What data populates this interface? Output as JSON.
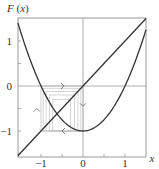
{
  "chart_data": {
    "type": "line",
    "title": "",
    "xlabel": "x",
    "ylabel": "F(x)",
    "xlim": [
      -1.55,
      1.5
    ],
    "ylim": [
      -1.58,
      1.52
    ],
    "xticks": [
      -1,
      0,
      1
    ],
    "yticks": [
      -1,
      0,
      1
    ],
    "xtick_labels": [
      "−1",
      "0",
      "1"
    ],
    "ytick_labels": [
      "−1",
      "0",
      "1"
    ],
    "grid": false,
    "legend": null,
    "series": [
      {
        "name": "F(x) = x^2 - 1",
        "kind": "parabola",
        "color": "#333333"
      },
      {
        "name": "y = x",
        "kind": "identity",
        "color": "#333333"
      }
    ],
    "cobweb": {
      "description": "Orbit iterations approaching the period-2 cycle {0, -1}",
      "boxes": [
        [
          -0.95,
          -0.05
        ],
        [
          -0.88,
          -0.12
        ],
        [
          -0.8,
          -0.2
        ],
        [
          -0.72,
          -0.3
        ]
      ],
      "arrows": [
        {
          "x": -0.45,
          "y": 0,
          "dir": "right"
        },
        {
          "x": 0,
          "y": -0.45,
          "dir": "down"
        },
        {
          "x": -0.5,
          "y": -1,
          "dir": "left"
        },
        {
          "x": -1.1,
          "y": -0.5,
          "dir": "up"
        }
      ],
      "color": "#bbbbbb"
    }
  }
}
